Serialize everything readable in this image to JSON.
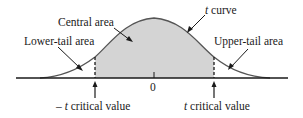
{
  "diagram": {
    "labels": {
      "central_area": "Central area",
      "t_curve_t": "t",
      "t_curve_rest": " curve",
      "lower_tail": "Lower-tail area",
      "upper_tail": "Upper-tail area",
      "zero": "0",
      "neg_crit_minus": "– ",
      "neg_crit_t": "t",
      "neg_crit_rest": " critical value",
      "pos_crit_t": "t",
      "pos_crit_rest": " critical value"
    },
    "colors": {
      "curve": "#555555",
      "shade": "#d4d4d4",
      "axis": "#1a1a1a",
      "text": "#1a1a1a"
    }
  }
}
